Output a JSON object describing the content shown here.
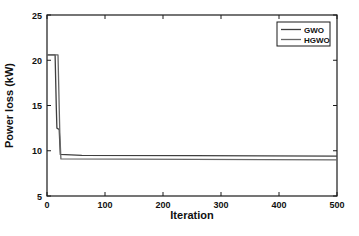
{
  "figure": {
    "background": "#ffffff",
    "frame_color": "#1a1a1a",
    "text_color": "#111111"
  },
  "chart_data": {
    "type": "line",
    "title": "",
    "xlabel": "Iteration",
    "ylabel": "Power loss (kW)",
    "xlim": [
      0,
      500
    ],
    "ylim": [
      5,
      25
    ],
    "xticks": [
      0,
      100,
      200,
      300,
      400,
      500
    ],
    "yticks": [
      5,
      10,
      15,
      20,
      25
    ],
    "grid": false,
    "legend_position": "top-right",
    "series": [
      {
        "name": "GWO",
        "color": "#3f3f3f",
        "points": [
          [
            0,
            20.6
          ],
          [
            14,
            20.6
          ],
          [
            16,
            14.8
          ],
          [
            17,
            12.5
          ],
          [
            21,
            12.35
          ],
          [
            23,
            9.6
          ],
          [
            60,
            9.5
          ],
          [
            250,
            9.45
          ],
          [
            500,
            9.4
          ]
        ]
      },
      {
        "name": "HGWO",
        "color": "#676767",
        "points": [
          [
            0,
            20.6
          ],
          [
            19,
            20.6
          ],
          [
            22,
            12.0
          ],
          [
            24,
            9.1
          ],
          [
            250,
            9.05
          ],
          [
            500,
            9.0
          ]
        ]
      }
    ]
  }
}
